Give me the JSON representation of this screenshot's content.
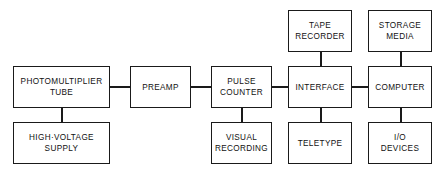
{
  "diagram": {
    "type": "block-diagram",
    "title": "",
    "nodes": [
      {
        "id": "tape_recorder",
        "label": "TAPE\nRECORDER",
        "x": 288,
        "y": 10,
        "w": 64,
        "h": 42
      },
      {
        "id": "storage_media",
        "label": "STORAGE\nMEDIA",
        "x": 368,
        "y": 10,
        "w": 64,
        "h": 42
      },
      {
        "id": "photomultiplier",
        "label": "PHOTOMULTIPLIER\nTUBE",
        "x": 13,
        "y": 66,
        "w": 97,
        "h": 42
      },
      {
        "id": "preamp",
        "label": "PREAMP",
        "x": 130,
        "y": 66,
        "w": 61,
        "h": 42
      },
      {
        "id": "pulse_counter",
        "label": "PULSE\nCOUNTER",
        "x": 211,
        "y": 66,
        "w": 61,
        "h": 42
      },
      {
        "id": "interface",
        "label": "INTERFACE",
        "x": 288,
        "y": 66,
        "w": 64,
        "h": 42
      },
      {
        "id": "computer",
        "label": "COMPUTER",
        "x": 368,
        "y": 66,
        "w": 64,
        "h": 42
      },
      {
        "id": "high_voltage",
        "label": "HIGH·VOLTAGE\nSUPPLY",
        "x": 13,
        "y": 122,
        "w": 97,
        "h": 42
      },
      {
        "id": "visual_recording",
        "label": "VISUAL\nRECORDING",
        "x": 211,
        "y": 122,
        "w": 61,
        "h": 42
      },
      {
        "id": "teletype",
        "label": "TELETYPE",
        "x": 288,
        "y": 122,
        "w": 64,
        "h": 42
      },
      {
        "id": "io_devices",
        "label": "I/O\nDEVICES",
        "x": 368,
        "y": 122,
        "w": 64,
        "h": 42
      }
    ],
    "connectors": [
      {
        "id": "photomultiplier-preamp",
        "from": "photomultiplier",
        "to": "preamp",
        "orient": "h",
        "x": 110,
        "y": 86,
        "len": 20
      },
      {
        "id": "preamp-pulse_counter",
        "from": "preamp",
        "to": "pulse_counter",
        "orient": "h",
        "x": 191,
        "y": 86,
        "len": 20
      },
      {
        "id": "pulse_counter-interface",
        "from": "pulse_counter",
        "to": "interface",
        "orient": "h",
        "x": 272,
        "y": 86,
        "len": 16
      },
      {
        "id": "interface-computer",
        "from": "interface",
        "to": "computer",
        "orient": "h",
        "x": 352,
        "y": 86,
        "len": 16
      },
      {
        "id": "photomultiplier-high_voltage",
        "from": "photomultiplier",
        "to": "high_voltage",
        "orient": "v",
        "x": 61,
        "y": 108,
        "len": 14
      },
      {
        "id": "pulse_counter-visual_recording",
        "from": "pulse_counter",
        "to": "visual_recording",
        "orient": "v",
        "x": 241,
        "y": 108,
        "len": 14
      },
      {
        "id": "interface-teletype",
        "from": "interface",
        "to": "teletype",
        "orient": "v",
        "x": 320,
        "y": 108,
        "len": 14
      },
      {
        "id": "computer-io_devices",
        "from": "computer",
        "to": "io_devices",
        "orient": "v",
        "x": 400,
        "y": 108,
        "len": 14
      },
      {
        "id": "tape_recorder-interface",
        "from": "tape_recorder",
        "to": "interface",
        "orient": "v",
        "x": 320,
        "y": 52,
        "len": 14
      },
      {
        "id": "storage_media-computer",
        "from": "storage_media",
        "to": "computer",
        "orient": "v",
        "x": 400,
        "y": 52,
        "len": 14
      }
    ]
  },
  "colors": {
    "stroke": "#1a1a1a",
    "background": "#ffffff",
    "text": "#111111"
  }
}
